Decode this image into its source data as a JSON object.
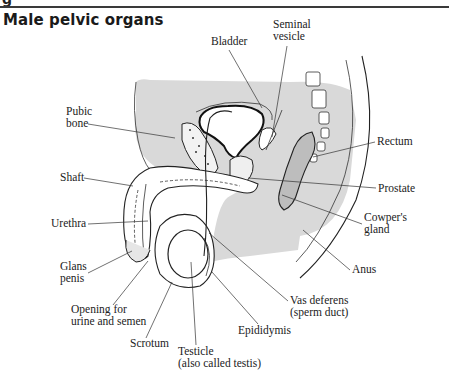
{
  "page": {
    "header_fragment": "g",
    "title": "Male pelvic organs"
  },
  "colors": {
    "shade": "#d9d9d9",
    "line": "#222222",
    "background": "#ffffff"
  },
  "diagram": {
    "labels": [
      {
        "id": "bladder",
        "lines": [
          "Bladder"
        ],
        "x": 211,
        "y": 45,
        "anchor": "start",
        "leader": [
          [
            229,
            50
          ],
          [
            262,
            108
          ]
        ]
      },
      {
        "id": "seminal-vesicle",
        "lines": [
          "Seminal",
          "vesicle"
        ],
        "x": 273,
        "y": 28,
        "anchor": "start",
        "leader": [
          [
            287,
            46
          ],
          [
            272,
            137
          ]
        ]
      },
      {
        "id": "pubic-bone",
        "lines": [
          "Pubic",
          "bone"
        ],
        "x": 66,
        "y": 115,
        "anchor": "start",
        "leader": [
          [
            88,
            124
          ],
          [
            175,
            138
          ]
        ]
      },
      {
        "id": "rectum",
        "lines": [
          "Rectum"
        ],
        "x": 377,
        "y": 145,
        "anchor": "start",
        "leader": [
          [
            375,
            142
          ],
          [
            313,
            157
          ]
        ]
      },
      {
        "id": "shaft",
        "lines": [
          "Shaft"
        ],
        "x": 60,
        "y": 181,
        "anchor": "start",
        "leader": [
          [
            84,
            178
          ],
          [
            133,
            186
          ]
        ]
      },
      {
        "id": "prostate",
        "lines": [
          "Prostate"
        ],
        "x": 378,
        "y": 192,
        "anchor": "start",
        "leader": [
          [
            376,
            188
          ],
          [
            248,
            178
          ]
        ]
      },
      {
        "id": "cowpers-gland",
        "lines": [
          "Cowper's",
          "gland"
        ],
        "x": 364,
        "y": 221,
        "anchor": "start",
        "leader": [
          [
            362,
            224
          ],
          [
            282,
            195
          ]
        ]
      },
      {
        "id": "urethra",
        "lines": [
          "Urethra"
        ],
        "x": 51,
        "y": 227,
        "anchor": "start",
        "leader": [
          [
            88,
            224
          ],
          [
            148,
            221
          ]
        ]
      },
      {
        "id": "anus",
        "lines": [
          "Anus"
        ],
        "x": 352,
        "y": 273,
        "anchor": "start",
        "leader": [
          [
            350,
            270
          ],
          [
            303,
            230
          ]
        ]
      },
      {
        "id": "glans-penis",
        "lines": [
          "Glans",
          "penis"
        ],
        "x": 60,
        "y": 270,
        "anchor": "start",
        "leader": [
          [
            88,
            273
          ],
          [
            132,
            251
          ]
        ]
      },
      {
        "id": "vas-deferens",
        "lines": [
          "Vas deferens",
          "(sperm duct)"
        ],
        "x": 290,
        "y": 304,
        "anchor": "start",
        "leader": [
          [
            288,
            301
          ],
          [
            209,
            233
          ]
        ]
      },
      {
        "id": "opening-for-urine-and-semen",
        "lines": [
          "Opening for",
          "urine and semen"
        ],
        "x": 71,
        "y": 313,
        "anchor": "start",
        "leader": [
          [
            113,
            305
          ],
          [
            148,
            261
          ]
        ]
      },
      {
        "id": "epididymis",
        "lines": [
          "Epididymis"
        ],
        "x": 238,
        "y": 334,
        "anchor": "start",
        "leader": [
          [
            258,
            324
          ],
          [
            212,
            272
          ]
        ]
      },
      {
        "id": "scrotum",
        "lines": [
          "Scrotum"
        ],
        "x": 130,
        "y": 347,
        "anchor": "start",
        "leader": [
          [
            146,
            338
          ],
          [
            172,
            282
          ]
        ]
      },
      {
        "id": "testicle",
        "lines": [
          "Testicle",
          "(also called testis)"
        ],
        "x": 178,
        "y": 355,
        "anchor": "start",
        "leader": [
          [
            196,
            345
          ],
          [
            191,
            262
          ]
        ]
      }
    ]
  }
}
